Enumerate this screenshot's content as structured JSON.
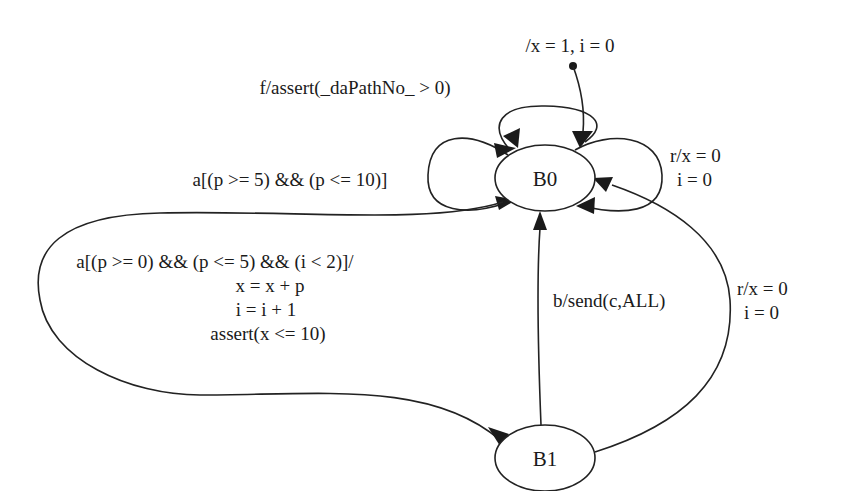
{
  "diagram": {
    "type": "state-machine",
    "states": [
      {
        "id": "B0",
        "label": "B0",
        "initial": true
      },
      {
        "id": "B1",
        "label": "B1",
        "initial": false
      }
    ],
    "initial_transition": {
      "to": "B0",
      "label": "/x = 1, i = 0"
    },
    "transitions": [
      {
        "from": "B0",
        "to": "B0",
        "label_lines": [
          "f/assert(_daPathNo_ > 0)"
        ]
      },
      {
        "from": "B0",
        "to": "B0",
        "label_lines": [
          "a[(p >= 5) && (p <= 10)]"
        ]
      },
      {
        "from": "B0",
        "to": "B0",
        "label_lines": [
          "r/x = 0",
          "i = 0"
        ]
      },
      {
        "from": "B0",
        "to": "B1",
        "label_lines": [
          "a[(p >= 0) && (p <= 5) && (i < 2)]/",
          "x = x + p",
          "i = i + 1",
          "assert(x <= 10)"
        ]
      },
      {
        "from": "B1",
        "to": "B0",
        "label_lines": [
          "b/send(c,ALL)"
        ]
      },
      {
        "from": "B1",
        "to": "B0",
        "label_lines": [
          "r/x = 0",
          "i = 0"
        ]
      }
    ]
  }
}
